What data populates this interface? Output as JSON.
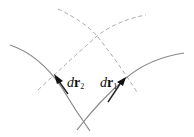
{
  "diagram": {
    "type": "curvilinear-coordinates",
    "labels": {
      "dr2": {
        "italic": "d",
        "bold": "r",
        "sub": "2"
      },
      "dr1": {
        "italic": "d",
        "bold": "r",
        "sub": "1"
      }
    },
    "colors": {
      "solid_curve": "#8a8a8a",
      "dashed_curve": "#a8a8a8",
      "arrow": "#111111"
    }
  }
}
